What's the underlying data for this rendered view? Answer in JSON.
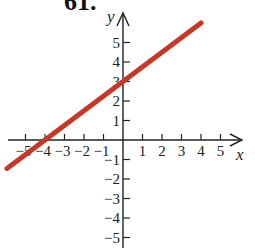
{
  "problem": {
    "number": "61."
  },
  "chart_data": {
    "type": "line",
    "title": "",
    "xlabel": "x",
    "ylabel": "y",
    "xlim": [
      -6,
      6
    ],
    "ylim": [
      -5.5,
      6
    ],
    "x_ticks": [
      -5,
      -4,
      -3,
      -2,
      -1,
      1,
      2,
      3,
      4,
      5
    ],
    "x_tick_labels": [
      "−5",
      "−4",
      "−3",
      "−2",
      "−1",
      "1",
      "2",
      "3",
      "4",
      "5"
    ],
    "y_ticks": [
      -5,
      -4,
      -3,
      -2,
      -1,
      1,
      2,
      3,
      4,
      5
    ],
    "y_tick_labels": [
      "−5",
      "−4",
      "−3",
      "−2",
      "−1",
      "1",
      "2",
      "3",
      "4",
      "5"
    ],
    "grid": false,
    "series": [
      {
        "name": "line",
        "equation": "y = (3/4)x + 3",
        "color": "#c0392b",
        "x": [
          -5.95,
          -4,
          0,
          4
        ],
        "y": [
          -1.46,
          0,
          3,
          6
        ]
      }
    ],
    "annotations": {
      "x_intercept": [
        -4,
        0
      ],
      "y_intercept": [
        0,
        3
      ]
    }
  },
  "colors": {
    "axis": "#222222",
    "line": "#c0392b"
  }
}
